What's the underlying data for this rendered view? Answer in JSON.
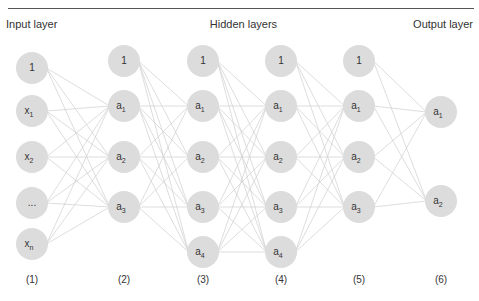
{
  "headers": {
    "input": "Input layer",
    "hidden": "Hidden layers",
    "output": "Output layer"
  },
  "layers": [
    {
      "id": "1",
      "label": "(1)",
      "role": "input",
      "nodes": [
        {
          "base": "1",
          "sub": ""
        },
        {
          "base": "x",
          "sub": "1"
        },
        {
          "base": "x",
          "sub": "2"
        },
        {
          "base": "...",
          "sub": ""
        },
        {
          "base": "x",
          "sub": "n"
        }
      ]
    },
    {
      "id": "2",
      "label": "(2)",
      "role": "hidden",
      "nodes": [
        {
          "base": "1",
          "sub": ""
        },
        {
          "base": "a",
          "sub": "1"
        },
        {
          "base": "a",
          "sub": "2"
        },
        {
          "base": "a",
          "sub": "3"
        }
      ]
    },
    {
      "id": "3",
      "label": "(3)",
      "role": "hidden",
      "nodes": [
        {
          "base": "1",
          "sub": ""
        },
        {
          "base": "a",
          "sub": "1"
        },
        {
          "base": "a",
          "sub": "2"
        },
        {
          "base": "a",
          "sub": "3"
        },
        {
          "base": "a",
          "sub": "4"
        }
      ]
    },
    {
      "id": "4",
      "label": "(4)",
      "role": "hidden",
      "nodes": [
        {
          "base": "1",
          "sub": ""
        },
        {
          "base": "a",
          "sub": "1"
        },
        {
          "base": "a",
          "sub": "2"
        },
        {
          "base": "a",
          "sub": "3"
        },
        {
          "base": "a",
          "sub": "4"
        }
      ]
    },
    {
      "id": "5",
      "label": "(5)",
      "role": "hidden",
      "nodes": [
        {
          "base": "1",
          "sub": ""
        },
        {
          "base": "a",
          "sub": "1"
        },
        {
          "base": "a",
          "sub": "2"
        },
        {
          "base": "a",
          "sub": "3"
        }
      ]
    },
    {
      "id": "6",
      "label": "(6)",
      "role": "output",
      "nodes": [
        {
          "base": "a",
          "sub": "1"
        },
        {
          "base": "a",
          "sub": "2"
        }
      ]
    }
  ],
  "colors": {
    "node_fill": "#dcdcdc",
    "edge": "#cfcfcf",
    "text": "#333333",
    "rule": "#555555"
  }
}
